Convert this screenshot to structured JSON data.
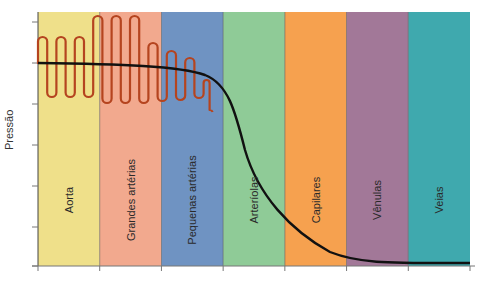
{
  "chart_data": {
    "type": "area",
    "title": "",
    "ylabel": "Pressão",
    "xlabel": "",
    "grid": false,
    "legend": "none",
    "categories": [
      "Aorta",
      "Grandes artérias",
      "Pequenas artérias",
      "Arteríolas",
      "Capilares",
      "Vênulas",
      "Veias"
    ],
    "band_colors": [
      "#efe08a",
      "#f2a98e",
      "#6f93c2",
      "#8fcb97",
      "#f6a14f",
      "#a27898",
      "#3fa9ae"
    ],
    "series": [
      {
        "name": "Pressão média",
        "color": "#111111",
        "description": "Mean pressure: roughly constant high in aorta/large arteries, declines in small arteries, drops steeply across arterioles and capillaries, near baseline in venules and veins",
        "values_relative": [
          0.8,
          0.79,
          0.72,
          0.35,
          0.14,
          0.03,
          0.02
        ]
      },
      {
        "name": "Pressão pulsátil",
        "color": "#b5441f",
        "description": "Pulsatile (oscillating) pressure: moderate amplitude in aorta, largest amplitude in large arteries, damped in small arteries, vanishing in arterioles",
        "amplitude_relative": [
          0.24,
          0.34,
          0.18,
          0.05,
          0,
          0,
          0
        ]
      }
    ],
    "y_ticks_count": 7
  },
  "labels": {
    "y_axis": "Pressão",
    "bands": [
      "Aorta",
      "Grandes artérias",
      "Pequenas artérias",
      "Arteríolas",
      "Capilares",
      "Vênulas",
      "Veias"
    ]
  }
}
